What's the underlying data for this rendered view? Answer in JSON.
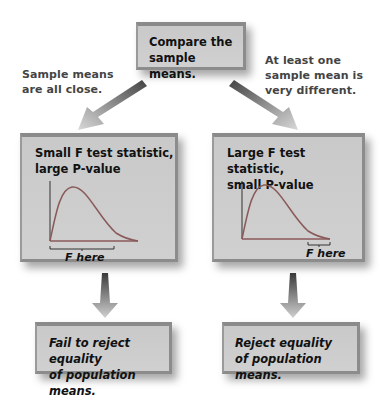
{
  "top_box": {
    "text": "Compare the\nsample means."
  },
  "branches": {
    "left_note": "Sample means\nare all close.",
    "right_note": "At least one\nsample mean is\nvery different."
  },
  "left_panel": {
    "title": "Small F test statistic,\nlarge P-value",
    "f_label": "F here"
  },
  "right_panel": {
    "title": "Large F test statistic,\nsmall P-value",
    "f_label": "F here"
  },
  "left_conclusion": {
    "text": "Fail to reject equality\nof population means."
  },
  "right_conclusion": {
    "text": "Reject equality\nof population means."
  },
  "colors": {
    "box_fill": "#cdcdcd",
    "box_border": "#8a8a8a",
    "curve": "#8a5a5a",
    "arrow_dark": "#555555",
    "arrow_light": "#cccccc"
  }
}
